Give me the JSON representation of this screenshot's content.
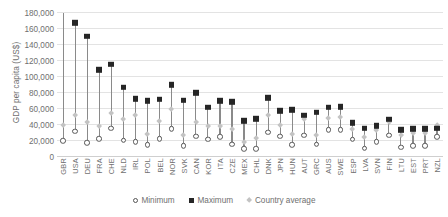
{
  "chart_data": {
    "type": "scatter",
    "title": "",
    "xlabel": "",
    "ylabel": "GDP per capita (US$)",
    "ylim": [
      0,
      180000
    ],
    "ytick_step": 20000,
    "grid": true,
    "legend_position": "bottom",
    "ytick_labels": [
      "180,000",
      "160,000",
      "140,000",
      "120,000",
      "100,000",
      "80,000",
      "60,000",
      "40,000",
      "20,000",
      "0"
    ],
    "categories": [
      "GBR",
      "USA",
      "DEU",
      "FRA",
      "CHE",
      "NLD",
      "IRL",
      "POL",
      "BEL",
      "NOR",
      "SVK",
      "CAN",
      "KOR",
      "ITA",
      "CZE",
      "MEX",
      "CHL",
      "DNK",
      "JPN",
      "HUN",
      "AUT",
      "GRC",
      "AUS",
      "SWE",
      "ESP",
      "LVA",
      "SVN",
      "FIN",
      "LTU",
      "EST",
      "PRT",
      "NZL"
    ],
    "series": [
      {
        "name": "Maximum",
        "marker": "filled-square",
        "color": "#262626",
        "values": [
          198000,
          168000,
          151000,
          109000,
          116000,
          87000,
          73000,
          70000,
          72000,
          90000,
          71000,
          80000,
          62000,
          70000,
          69000,
          45000,
          48000,
          74000,
          58000,
          59000,
          52000,
          56000,
          62000,
          63000,
          43000,
          36000,
          39000,
          47000,
          34000,
          35000,
          35000,
          36000
        ]
      },
      {
        "name": "Minimum",
        "marker": "open-circle",
        "color": "#555555",
        "values": [
          20000,
          32000,
          18000,
          23000,
          36000,
          21000,
          19000,
          15000,
          23000,
          35000,
          14000,
          26000,
          22000,
          25000,
          16000,
          10000,
          10000,
          31000,
          26000,
          15000,
          27000,
          16000,
          34000,
          34000,
          22000,
          11000,
          19000,
          27000,
          12000,
          14000,
          14000,
          25000
        ]
      },
      {
        "name": "Country average",
        "marker": "diamond",
        "color": "#c3c3c3",
        "values": [
          39000,
          52000,
          43000,
          38000,
          54000,
          47000,
          52000,
          28000,
          44000,
          59000,
          27000,
          43000,
          38000,
          38000,
          34000,
          18000,
          23000,
          52000,
          39000,
          28000,
          47000,
          27000,
          48000,
          49000,
          34000,
          25000,
          33000,
          43000,
          27000,
          29000,
          30000,
          39000
        ]
      }
    ],
    "legend": [
      "Minimum",
      "Maximum",
      "Country average"
    ]
  }
}
